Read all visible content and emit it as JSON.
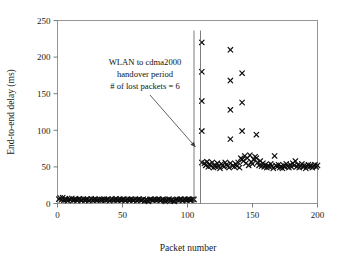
{
  "figure": {
    "background_color": "#ffffff",
    "marker_color": "#0d0d0d",
    "axis_color": "#8a8a8a",
    "marker_symbol": "x"
  },
  "annotation": {
    "line1": "WLAN to cdma2000",
    "line2": "handover period",
    "line3": "# of lost packets = 6",
    "lost_packets": 6,
    "handover_start_packet": 105,
    "handover_end_packet": 110
  },
  "chart_data": {
    "type": "scatter",
    "title": "",
    "xlabel": "Packet number",
    "ylabel": "End-to-end delay (ms)",
    "xlim": [
      0,
      200
    ],
    "ylim": [
      0,
      250
    ],
    "xticks": [
      0,
      50,
      100,
      150,
      200
    ],
    "yticks": [
      0,
      50,
      100,
      150,
      200,
      250
    ],
    "xtick_labels": [
      "0",
      "50",
      "100",
      "150",
      "200"
    ],
    "ytick_labels": [
      "0",
      "50",
      "100",
      "150",
      "200",
      "250"
    ],
    "grid": false,
    "legend": null,
    "series": [
      {
        "name": "End-to-end delay",
        "marker": "x",
        "color": "#0d0d0d",
        "points": [
          [
            1,
            6.0
          ],
          [
            2,
            7.5
          ],
          [
            3,
            5.0
          ],
          [
            4,
            8.0
          ],
          [
            5,
            4.5
          ],
          [
            6,
            6.5
          ],
          [
            7,
            5.5
          ],
          [
            8,
            4.0
          ],
          [
            9,
            6.0
          ],
          [
            10,
            5.0
          ],
          [
            11,
            7.0
          ],
          [
            12,
            4.5
          ],
          [
            13,
            5.5
          ],
          [
            14,
            6.0
          ],
          [
            15,
            4.0
          ],
          [
            16,
            5.5
          ],
          [
            17,
            6.5
          ],
          [
            18,
            4.5
          ],
          [
            19,
            5.0
          ],
          [
            20,
            6.0
          ],
          [
            21,
            4.5
          ],
          [
            22,
            5.5
          ],
          [
            23,
            6.0
          ],
          [
            24,
            4.0
          ],
          [
            25,
            5.0
          ],
          [
            26,
            6.5
          ],
          [
            27,
            4.5
          ],
          [
            28,
            5.5
          ],
          [
            29,
            6.0
          ],
          [
            30,
            4.5
          ],
          [
            31,
            5.0
          ],
          [
            32,
            6.0
          ],
          [
            33,
            4.5
          ],
          [
            34,
            5.5
          ],
          [
            35,
            5.0
          ],
          [
            36,
            6.0
          ],
          [
            37,
            4.5
          ],
          [
            38,
            5.5
          ],
          [
            39,
            6.0
          ],
          [
            40,
            4.0
          ],
          [
            41,
            5.0
          ],
          [
            42,
            6.0
          ],
          [
            43,
            4.5
          ],
          [
            44,
            5.5
          ],
          [
            45,
            6.5
          ],
          [
            46,
            4.5
          ],
          [
            47,
            5.0
          ],
          [
            48,
            6.0
          ],
          [
            49,
            4.5
          ],
          [
            50,
            5.5
          ],
          [
            51,
            6.0
          ],
          [
            52,
            4.0
          ],
          [
            53,
            5.0
          ],
          [
            54,
            6.0
          ],
          [
            55,
            4.5
          ],
          [
            56,
            5.5
          ],
          [
            57,
            6.0
          ],
          [
            58,
            4.5
          ],
          [
            59,
            5.0
          ],
          [
            60,
            6.0
          ],
          [
            61,
            4.0
          ],
          [
            62,
            5.5
          ],
          [
            63,
            6.0
          ],
          [
            64,
            4.5
          ],
          [
            65,
            5.0
          ],
          [
            66,
            6.0
          ],
          [
            67,
            3.5
          ],
          [
            68,
            5.0
          ],
          [
            69,
            4.0
          ],
          [
            70,
            3.0
          ],
          [
            71,
            5.5
          ],
          [
            72,
            6.0
          ],
          [
            73,
            4.5
          ],
          [
            74,
            5.0
          ],
          [
            75,
            6.0
          ],
          [
            76,
            4.5
          ],
          [
            77,
            5.5
          ],
          [
            78,
            6.0
          ],
          [
            79,
            4.0
          ],
          [
            80,
            5.0
          ],
          [
            81,
            6.0
          ],
          [
            82,
            4.5
          ],
          [
            83,
            3.0
          ],
          [
            84,
            4.0
          ],
          [
            85,
            5.5
          ],
          [
            86,
            6.0
          ],
          [
            87,
            4.5
          ],
          [
            88,
            5.0
          ],
          [
            89,
            3.5
          ],
          [
            90,
            3.0
          ],
          [
            91,
            5.0
          ],
          [
            92,
            6.0
          ],
          [
            93,
            4.5
          ],
          [
            94,
            5.5
          ],
          [
            95,
            6.0
          ],
          [
            96,
            4.0
          ],
          [
            97,
            5.0
          ],
          [
            98,
            6.0
          ],
          [
            99,
            4.5
          ],
          [
            100,
            5.5
          ],
          [
            101,
            6.0
          ],
          [
            102,
            4.5
          ],
          [
            103,
            5.0
          ],
          [
            104,
            6.0
          ],
          [
            105,
            5.5
          ],
          [
            111,
            220.0
          ],
          [
            111,
            180.0
          ],
          [
            111,
            140.0
          ],
          [
            111,
            99.0
          ],
          [
            111,
            56.0
          ],
          [
            113,
            55.0
          ],
          [
            114,
            52.0
          ],
          [
            115,
            57.0
          ],
          [
            116,
            50.0
          ],
          [
            117,
            54.0
          ],
          [
            118,
            51.0
          ],
          [
            119,
            56.0
          ],
          [
            120,
            49.0
          ],
          [
            121,
            53.0
          ],
          [
            122,
            50.0
          ],
          [
            123,
            55.0
          ],
          [
            124,
            51.0
          ],
          [
            125,
            48.0
          ],
          [
            126,
            54.0
          ],
          [
            127,
            52.0
          ],
          [
            128,
            50.0
          ],
          [
            129,
            56.0
          ],
          [
            130,
            53.0
          ],
          [
            131,
            51.0
          ],
          [
            132,
            49.0
          ],
          [
            133,
            210.0
          ],
          [
            133,
            168.0
          ],
          [
            133,
            128.0
          ],
          [
            133,
            88.0
          ],
          [
            133,
            55.0
          ],
          [
            135,
            52.0
          ],
          [
            136,
            50.0
          ],
          [
            137,
            54.0
          ],
          [
            138,
            51.0
          ],
          [
            139,
            56.0
          ],
          [
            140,
            49.0
          ],
          [
            141,
            62.0
          ],
          [
            142,
            178.0
          ],
          [
            142,
            138.0
          ],
          [
            142,
            99.0
          ],
          [
            142,
            60.0
          ],
          [
            143,
            58.0
          ],
          [
            144,
            65.0
          ],
          [
            145,
            55.0
          ],
          [
            146,
            62.0
          ],
          [
            147,
            52.0
          ],
          [
            148,
            66.0
          ],
          [
            149,
            57.0
          ],
          [
            150,
            54.0
          ],
          [
            151,
            60.0
          ],
          [
            152,
            64.0
          ],
          [
            153,
            94.0
          ],
          [
            153,
            62.0
          ],
          [
            154,
            56.0
          ],
          [
            155,
            52.0
          ],
          [
            156,
            58.0
          ],
          [
            157,
            51.0
          ],
          [
            158,
            55.0
          ],
          [
            159,
            50.0
          ],
          [
            160,
            53.0
          ],
          [
            161,
            49.0
          ],
          [
            162,
            52.0
          ],
          [
            163,
            50.0
          ],
          [
            164,
            54.0
          ],
          [
            165,
            51.0
          ],
          [
            166,
            48.0
          ],
          [
            167,
            65.0
          ],
          [
            168,
            52.0
          ],
          [
            169,
            50.0
          ],
          [
            170,
            53.0
          ],
          [
            171,
            49.0
          ],
          [
            172,
            51.0
          ],
          [
            173,
            48.0
          ],
          [
            174,
            52.0
          ],
          [
            175,
            50.0
          ],
          [
            176,
            54.0
          ],
          [
            177,
            51.0
          ],
          [
            178,
            49.0
          ],
          [
            179,
            53.0
          ],
          [
            180,
            50.0
          ],
          [
            181,
            55.0
          ],
          [
            182,
            52.0
          ],
          [
            183,
            58.0
          ],
          [
            184,
            50.0
          ],
          [
            185,
            53.0
          ],
          [
            186,
            49.0
          ],
          [
            187,
            51.0
          ],
          [
            188,
            54.0
          ],
          [
            189,
            50.0
          ],
          [
            190,
            52.0
          ],
          [
            191,
            48.0
          ],
          [
            192,
            51.0
          ],
          [
            193,
            53.0
          ],
          [
            194,
            50.0
          ],
          [
            195,
            52.0
          ],
          [
            196,
            49.0
          ],
          [
            197,
            51.0
          ],
          [
            198,
            53.0
          ],
          [
            199,
            50.0
          ],
          [
            200,
            52.0
          ]
        ]
      }
    ]
  }
}
